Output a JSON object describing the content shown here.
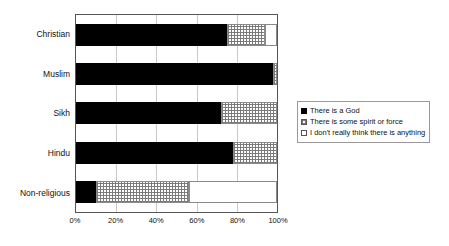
{
  "chart_data": {
    "type": "bar",
    "orientation": "horizontal",
    "stacked": true,
    "normalized_percent": true,
    "title": "",
    "xlabel": "",
    "ylabel": "",
    "xlim": [
      0,
      100
    ],
    "grid": true,
    "legend_position": "right",
    "categories": [
      "Christian",
      "Muslim",
      "Sikh",
      "Hindu",
      "Non-religious"
    ],
    "x_tick_labels": [
      "0%",
      "20%",
      "40%",
      "60%",
      "80%",
      "100%"
    ],
    "x_ticks": [
      0,
      20,
      40,
      60,
      80,
      100
    ],
    "series": [
      {
        "name": "There is a God",
        "swatch": "black-filled-square",
        "values": [
          75,
          98,
          72,
          78,
          10
        ]
      },
      {
        "name": "There is some spirit or force",
        "swatch": "dotted-square",
        "values": [
          19,
          2,
          28,
          22,
          46
        ]
      },
      {
        "name": "I don't really think there is anything",
        "swatch": "white-square",
        "values": [
          6,
          0,
          0,
          0,
          44
        ]
      }
    ],
    "colors": {
      "there_is_a_god": "#000000",
      "some_spirit_or_force": "#dcdcdc",
      "not_anything": "#ffffff",
      "gridline": "#c9c9c9",
      "axis": "#555555",
      "text": "#111111"
    }
  },
  "legend": {
    "items": [
      {
        "label": "There is a God"
      },
      {
        "label": "There is some spirit or force"
      },
      {
        "label": "I don't really think there is anything"
      }
    ]
  }
}
